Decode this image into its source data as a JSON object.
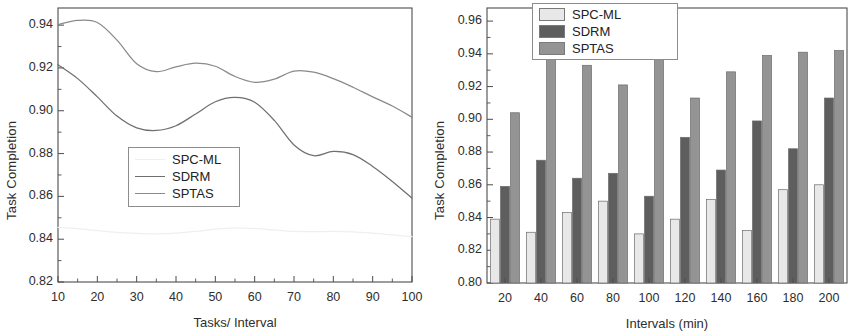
{
  "figure": {
    "background": "#ffffff",
    "panels": [
      "line-chart",
      "bar-chart"
    ]
  },
  "chart_data": [
    {
      "id": "left",
      "type": "line",
      "title": "",
      "xlabel": "Tasks/ Interval",
      "ylabel": "Task Completion",
      "xlim": [
        10,
        100
      ],
      "ylim": [
        0.82,
        0.948
      ],
      "xticks": [
        10,
        20,
        30,
        40,
        50,
        60,
        70,
        80,
        90,
        100
      ],
      "xtick_labels": [
        "10",
        "20",
        "30",
        "40",
        "50",
        "60",
        "70",
        "80",
        "90",
        "100"
      ],
      "yticks": [
        0.82,
        0.84,
        0.86,
        0.88,
        0.9,
        0.92,
        0.94
      ],
      "ytick_labels": [
        "0.82",
        "0.84",
        "0.86",
        "0.88",
        "0.90",
        "0.92",
        "0.94"
      ],
      "grid": false,
      "legend_position": "center-left",
      "x": [
        10,
        15,
        20,
        25,
        30,
        35,
        40,
        45,
        50,
        55,
        60,
        65,
        70,
        75,
        80,
        85,
        90,
        95,
        100
      ],
      "series": [
        {
          "name": "SPC-ML",
          "color": "#efefef",
          "values": [
            0.8455,
            0.8449,
            0.844,
            0.8432,
            0.8427,
            0.8425,
            0.8428,
            0.8436,
            0.8447,
            0.8453,
            0.845,
            0.8443,
            0.8437,
            0.8435,
            0.8436,
            0.8434,
            0.8428,
            0.842,
            0.8412
          ]
        },
        {
          "name": "SDRM",
          "color": "#6f6f6f",
          "values": [
            0.9215,
            0.915,
            0.9065,
            0.8975,
            0.892,
            0.8908,
            0.893,
            0.8985,
            0.9042,
            0.9062,
            0.904,
            0.8955,
            0.884,
            0.879,
            0.881,
            0.8795,
            0.874,
            0.867,
            0.8592
          ]
        },
        {
          "name": "SPTAS",
          "color": "#8a8a8a",
          "values": [
            0.9402,
            0.9422,
            0.9412,
            0.933,
            0.922,
            0.9183,
            0.9205,
            0.9222,
            0.9208,
            0.916,
            0.9133,
            0.9148,
            0.9185,
            0.918,
            0.915,
            0.911,
            0.9065,
            0.9022,
            0.897
          ]
        }
      ]
    },
    {
      "id": "right",
      "type": "bar",
      "title": "",
      "xlabel": "Intervals (min)",
      "ylabel": "Task Completion",
      "ylim": [
        0.8,
        0.968
      ],
      "yticks": [
        0.8,
        0.82,
        0.84,
        0.86,
        0.88,
        0.9,
        0.92,
        0.94,
        0.96
      ],
      "ytick_labels": [
        "0.80",
        "0.82",
        "0.84",
        "0.86",
        "0.88",
        "0.90",
        "0.92",
        "0.94",
        "0.96"
      ],
      "grid": false,
      "legend_position": "top-center",
      "categories": [
        "20",
        "40",
        "60",
        "80",
        "100",
        "120",
        "140",
        "160",
        "180",
        "200"
      ],
      "series": [
        {
          "name": "SPC-ML",
          "color": "#e8e8e8",
          "values": [
            0.839,
            0.831,
            0.843,
            0.85,
            0.83,
            0.839,
            0.851,
            0.832,
            0.857,
            0.86
          ]
        },
        {
          "name": "SDRM",
          "color": "#5e5e5e",
          "values": [
            0.859,
            0.875,
            0.864,
            0.867,
            0.853,
            0.889,
            0.869,
            0.899,
            0.882,
            0.913
          ]
        },
        {
          "name": "SPTAS",
          "color": "#949494",
          "values": [
            0.904,
            0.938,
            0.933,
            0.921,
            0.945,
            0.913,
            0.929,
            0.939,
            0.941,
            0.942
          ]
        }
      ]
    }
  ]
}
